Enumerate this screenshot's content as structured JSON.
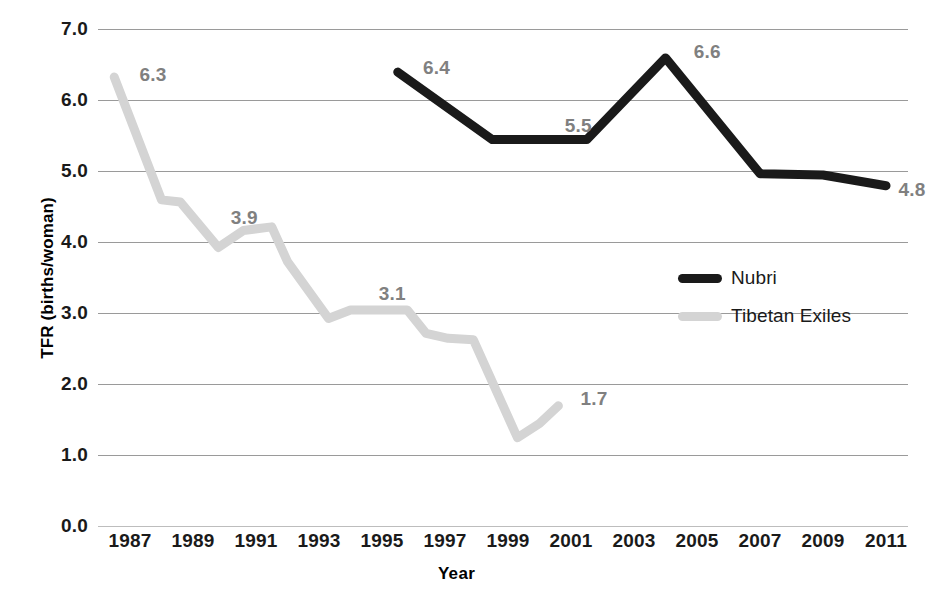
{
  "chart_data": {
    "type": "line",
    "title": "",
    "xlabel": "Year",
    "ylabel": "TFR (births/woman)",
    "xlim": [
      1986,
      2011.5
    ],
    "ylim": [
      0.0,
      7.0
    ],
    "grid": true,
    "legend_position": "center-right",
    "y_ticks": [
      "7.0",
      "6.0",
      "5.0",
      "4.0",
      "3.0",
      "2.0",
      "1.0",
      "0.0"
    ],
    "y_tick_values": [
      7.0,
      6.0,
      5.0,
      4.0,
      3.0,
      2.0,
      1.0,
      0.0
    ],
    "x_ticks": [
      "1987",
      "1989",
      "1991",
      "1993",
      "1995",
      "1997",
      "1999",
      "2001",
      "2003",
      "2005",
      "2007",
      "2009",
      "2011"
    ],
    "x_tick_values": [
      1987,
      1989,
      1991,
      1993,
      1995,
      1997,
      1999,
      2001,
      2003,
      2005,
      2007,
      2009,
      2011
    ],
    "series": [
      {
        "name": "Nubri",
        "color": "#1a1a1a",
        "x": [
          1995.5,
          1998.5,
          2001.5,
          2004.0,
          2007.0,
          2009.0,
          2011.0
        ],
        "values": [
          6.4,
          5.45,
          5.45,
          6.6,
          4.97,
          4.95,
          4.8
        ],
        "labels": [
          {
            "text": "6.4",
            "x": 1996.3,
            "y": 6.45
          },
          {
            "text": "5.5",
            "x": 2000.8,
            "y": 5.62
          },
          {
            "text": "6.6",
            "x": 2004.9,
            "y": 6.67
          },
          {
            "text": "4.8",
            "x": 2011.4,
            "y": 4.72
          }
        ]
      },
      {
        "name": "Tibetan Exiles",
        "color": "#d4d4d4",
        "x": [
          1986.5,
          1988.0,
          1988.6,
          1989.8,
          1990.6,
          1991.5,
          1992.0,
          1993.3,
          1994.0,
          1995.8,
          1996.4,
          1997.1,
          1997.9,
          1999.3,
          2000.0,
          2000.6
        ],
        "values": [
          6.33,
          4.6,
          4.57,
          3.93,
          4.17,
          4.22,
          3.73,
          2.93,
          3.05,
          3.05,
          2.72,
          2.65,
          2.63,
          1.25,
          1.45,
          1.7
        ],
        "labels": [
          {
            "text": "6.3",
            "x": 1987.3,
            "y": 6.35
          },
          {
            "text": "3.9",
            "x": 1990.2,
            "y": 4.33
          },
          {
            "text": "3.1",
            "x": 1994.9,
            "y": 3.26
          },
          {
            "text": "1.7",
            "x": 2001.3,
            "y": 1.78
          }
        ]
      }
    ],
    "legend": [
      {
        "label": "Nubri",
        "color": "#1a1a1a"
      },
      {
        "label": "Tibetan Exiles",
        "color": "#d4d4d4"
      }
    ]
  }
}
